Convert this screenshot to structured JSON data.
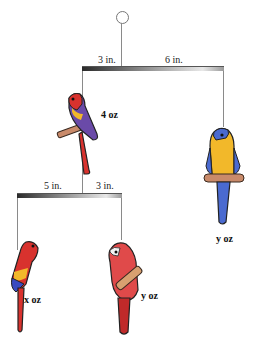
{
  "figure": {
    "top_beam": {
      "left_distance": "3 in.",
      "right_distance": "6 in.",
      "left_weight": "4 oz",
      "right_weight": "y oz"
    },
    "bottom_beam": {
      "left_distance": "5 in.",
      "right_distance": "3 in.",
      "left_weight": "x oz",
      "right_weight": "y oz"
    }
  },
  "icons": {
    "hook": "hook-icon",
    "parrot": "parrot-icon"
  },
  "colors": {
    "string": "#8a8a8a",
    "red_parrot": "#d8322e",
    "purple_parrot": "#6a4aa8",
    "yellow_parrot": "#f2b82a",
    "blue_tail": "#4a6ad0",
    "perch": "#c98a6a"
  }
}
